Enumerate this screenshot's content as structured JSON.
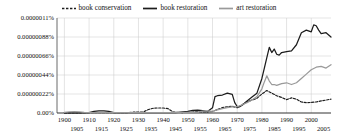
{
  "chart_data": {
    "type": "line",
    "title": "",
    "xlabel": "",
    "ylabel": "",
    "grid": true,
    "legend_position": "top-center",
    "xlim": [
      1897,
      2008
    ],
    "ylim": [
      0,
      1.1e-06
    ],
    "yticks": [
      0,
      2.2e-07,
      4.4e-07,
      6.6e-07,
      8.8e-07,
      1.1e-06
    ],
    "ytick_labels": [
      "0.00%",
      "0.00000022%",
      "0.00000044%",
      "0.00000066%",
      "0.00000088%",
      "0.0000011%"
    ],
    "xticks": [
      1900,
      1905,
      1910,
      1915,
      1920,
      1925,
      1930,
      1935,
      1940,
      1945,
      1950,
      1955,
      1960,
      1965,
      1970,
      1975,
      1980,
      1985,
      1990,
      1995,
      2000,
      2005
    ],
    "xtick_labels": [
      "1900",
      "1905",
      "1910",
      "1915",
      "1920",
      "1925",
      "1930",
      "1935",
      "1940",
      "1945",
      "1950",
      "1955",
      "1960",
      "1965",
      "1970",
      "1975",
      "1980",
      "1985",
      "1990",
      "1995",
      "2000",
      "2005"
    ],
    "series": [
      {
        "name": "book conservation",
        "color": "#1c1c1c",
        "style": "dashed",
        "x": [
          1900,
          1905,
          1910,
          1915,
          1920,
          1925,
          1928,
          1930,
          1932,
          1934,
          1936,
          1938,
          1940,
          1942,
          1944,
          1946,
          1948,
          1950,
          1952,
          1954,
          1956,
          1958,
          1960,
          1962,
          1964,
          1966,
          1968,
          1970,
          1972,
          1974,
          1976,
          1978,
          1980,
          1982,
          1984,
          1986,
          1988,
          1990,
          1992,
          1994,
          1996,
          1998,
          2000,
          2002,
          2004,
          2006,
          2008
        ],
        "y": [
          2e-09,
          2e-09,
          3e-09,
          4e-09,
          3e-09,
          3e-09,
          1e-08,
          1.2e-08,
          1.2e-08,
          4e-08,
          5.5e-08,
          5.8e-08,
          5.8e-08,
          5e-08,
          1.2e-08,
          6e-09,
          5e-09,
          6e-09,
          1.2e-08,
          1.4e-08,
          1.3e-08,
          1.2e-08,
          1.8e-08,
          4e-08,
          6.2e-08,
          7.2e-08,
          7.8e-08,
          6e-08,
          9.5e-08,
          1.3e-07,
          1.5e-07,
          1.7e-07,
          2.2e-07,
          2.6e-07,
          2.3e-07,
          2e-07,
          1.8e-07,
          1.55e-07,
          1.75e-07,
          1.6e-07,
          1.28e-07,
          1.2e-07,
          1.22e-07,
          1.28e-07,
          1.4e-07,
          1.5e-07,
          1.6e-07
        ]
      },
      {
        "name": "book restoration",
        "color": "#1c1c1c",
        "style": "solid",
        "x": [
          1900,
          1905,
          1910,
          1912,
          1914,
          1916,
          1918,
          1920,
          1925,
          1930,
          1935,
          1940,
          1945,
          1950,
          1952,
          1954,
          1956,
          1958,
          1960,
          1961,
          1962,
          1964,
          1966,
          1968,
          1969,
          1970,
          1971,
          1972,
          1974,
          1976,
          1978,
          1980,
          1981,
          1982,
          1983,
          1984,
          1985,
          1986,
          1987,
          1988,
          1990,
          1992,
          1994,
          1996,
          1998,
          2000,
          2001,
          2002,
          2003,
          2004,
          2006,
          2008
        ],
        "y": [
          2e-09,
          2e-09,
          4e-09,
          2e-08,
          2.4e-08,
          2.4e-08,
          2e-08,
          4e-09,
          3e-09,
          3e-09,
          4e-09,
          4e-09,
          4e-09,
          1.8e-08,
          3e-08,
          3.2e-08,
          2.8e-08,
          1.6e-08,
          6e-08,
          1.9e-07,
          2e-07,
          2.08e-07,
          2.3e-07,
          2.15e-07,
          1.2e-07,
          7.5e-08,
          7.2e-08,
          9e-08,
          1.4e-07,
          1.85e-07,
          2.3e-07,
          4e-07,
          5.2e-07,
          6.4e-07,
          7.6e-07,
          7e-07,
          7.4e-07,
          6.8e-07,
          6.7e-07,
          7e-07,
          7.1e-07,
          7.2e-07,
          7.9e-07,
          9.3e-07,
          9.6e-07,
          9.4e-07,
          1.02e-06,
          1.01e-06,
          9.6e-07,
          9.2e-07,
          9.3e-07,
          8.8e-07
        ]
      },
      {
        "name": "art restoration",
        "color": "#9a9a9a",
        "style": "solid",
        "x": [
          1900,
          1902,
          1904,
          1906,
          1908,
          1910,
          1915,
          1920,
          1925,
          1930,
          1935,
          1940,
          1945,
          1950,
          1952,
          1954,
          1956,
          1958,
          1960,
          1962,
          1964,
          1966,
          1968,
          1970,
          1972,
          1974,
          1976,
          1978,
          1980,
          1981,
          1982,
          1983,
          1984,
          1985,
          1986,
          1988,
          1990,
          1992,
          1994,
          1996,
          1998,
          2000,
          2002,
          2004,
          2006,
          2008
        ],
        "y": [
          6e-09,
          1.4e-08,
          1.6e-08,
          1.4e-08,
          8e-09,
          4e-09,
          4e-09,
          4e-09,
          3e-09,
          3e-09,
          4e-09,
          4e-09,
          4e-09,
          6e-09,
          8e-09,
          1e-08,
          2.2e-08,
          2.4e-08,
          2e-08,
          3.6e-08,
          5e-08,
          6.2e-08,
          7e-08,
          7.2e-08,
          9.5e-08,
          1.2e-07,
          1.5e-07,
          1.9e-07,
          2.8e-07,
          3.6e-07,
          4.3e-07,
          3.7e-07,
          3.3e-07,
          3.3e-07,
          3.2e-07,
          3.4e-07,
          3.5e-07,
          3.3e-07,
          3.5e-07,
          4e-07,
          4.5e-07,
          5e-07,
          5.3e-07,
          5.4e-07,
          5.2e-07,
          5.6e-07
        ]
      }
    ]
  },
  "legend": {
    "items": [
      {
        "label": "book conservation",
        "color": "#1c1c1c",
        "style": "dashed"
      },
      {
        "label": "book restoration",
        "color": "#1c1c1c",
        "style": "solid"
      },
      {
        "label": "art restoration",
        "color": "#9a9a9a",
        "style": "solid"
      }
    ]
  }
}
